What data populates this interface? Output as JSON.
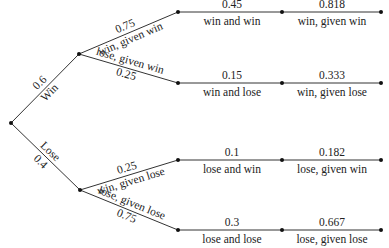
{
  "diagram": {
    "type": "probability-tree",
    "first_branches": [
      {
        "name": "Win",
        "prob": "0.6"
      },
      {
        "name": "Lose",
        "prob": "0.4"
      }
    ],
    "second_branches": [
      {
        "prob": "0.75",
        "label": "win, given win"
      },
      {
        "prob": "0.25",
        "label": "lose, given win"
      },
      {
        "prob": "0.25",
        "label": "win, given lose"
      },
      {
        "prob": "0.75",
        "label": "lose, given lose"
      }
    ],
    "joint": [
      {
        "prob": "0.45",
        "label": "win and win"
      },
      {
        "prob": "0.15",
        "label": "win and lose"
      },
      {
        "prob": "0.1",
        "label": "lose and win"
      },
      {
        "prob": "0.3",
        "label": "lose and lose"
      }
    ],
    "reverse": [
      {
        "prob": "0.818",
        "label": "win, given win"
      },
      {
        "prob": "0.333",
        "label": "win, given lose"
      },
      {
        "prob": "0.182",
        "label": "lose, given win"
      },
      {
        "prob": "0.667",
        "label": "lose, given lose"
      }
    ]
  }
}
